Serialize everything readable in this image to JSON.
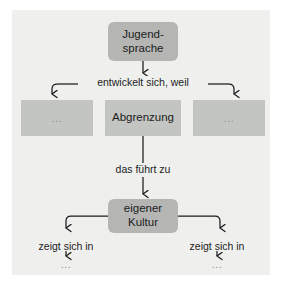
{
  "diagram": {
    "canvas_color": "#eff0ee",
    "node_fill_rounded": "#b5b6b4",
    "node_fill_plain": "#c3c5c2",
    "line_color": "#1c1c1c",
    "text_color": "#1c1c1c",
    "ellipsis_color": "#8d8f8c",
    "nodes": [
      {
        "id": "jugendsprache",
        "label": "Jugend-\nsprache",
        "shape": "rounded-rect"
      },
      {
        "id": "left_placeholder",
        "label": "...",
        "shape": "rect"
      },
      {
        "id": "abgrenzung",
        "label": "Abgrenzung",
        "shape": "rect"
      },
      {
        "id": "right_placeholder",
        "label": "...",
        "shape": "rect"
      },
      {
        "id": "eigener_kultur",
        "label": "eigener\nKultur",
        "shape": "rounded-rect"
      }
    ],
    "edge_labels": [
      {
        "id": "entwickelt",
        "label": "entwickelt sich, weil"
      },
      {
        "id": "das_fuehrt_zu",
        "label": "das führt zu"
      },
      {
        "id": "zeigt_sich_in_left",
        "label": "zeigt sich in"
      },
      {
        "id": "zeigt_sich_in_right",
        "label": "zeigt sich in"
      }
    ],
    "leaves": [
      {
        "id": "leaf_left",
        "label": "..."
      },
      {
        "id": "leaf_right",
        "label": "..."
      }
    ]
  }
}
